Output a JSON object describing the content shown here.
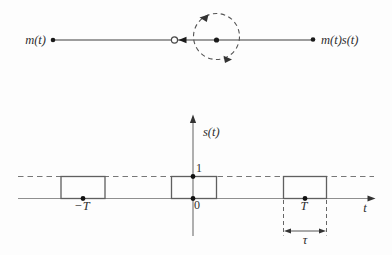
{
  "figure": {
    "background": "#fdfdfd",
    "ink": "#2e2e2e",
    "line_gray": "#8f8f8f",
    "shape_gray": "#5f5f5f"
  },
  "switch_diagram": {
    "input_label": "m(t)",
    "output_label": "m(t)s(t)"
  },
  "pulse_plot": {
    "y_axis_label": "s(t)",
    "x_axis_label": "t",
    "amplitude_label": "1",
    "origin_label": "0",
    "neg_period_label": "−T",
    "period_label": "T",
    "pulse_width_label": "τ",
    "waveform": {
      "type": "rectangular-pulse-train",
      "amplitude": 1,
      "pulse_centers": [
        "−T",
        "0",
        "T"
      ],
      "pulse_width": "τ",
      "dashed_level": 1
    }
  }
}
